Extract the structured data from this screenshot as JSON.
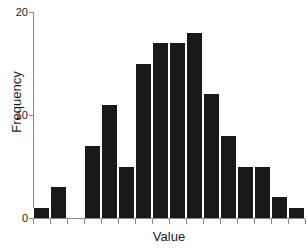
{
  "chart_data": {
    "type": "bar",
    "title": "",
    "subtitle": "",
    "xlabel": "Value",
    "ylabel": "Frequency",
    "grid": false,
    "legend": null,
    "ylim": [
      0,
      20
    ],
    "ytick_labels": [
      "0",
      "10",
      "20"
    ],
    "ytick_values": [
      0,
      10,
      20
    ],
    "xtick_labels": [
      "",
      "",
      "",
      "",
      "",
      "",
      "",
      "",
      "",
      "",
      "",
      "",
      "",
      "",
      "",
      ""
    ],
    "xtick_count": 16,
    "bar_count": 16,
    "categories": [
      "b1",
      "b2",
      "b3",
      "b4",
      "b5",
      "b6",
      "b7",
      "b8",
      "b9",
      "b10",
      "b11",
      "b12",
      "b13",
      "b14",
      "b15",
      "b16"
    ],
    "values": [
      1,
      3,
      0,
      7,
      11,
      5,
      15,
      17,
      17,
      18,
      12,
      8,
      5,
      5,
      2,
      0
    ],
    "outlier_bar": {
      "value": 1,
      "position_index": 15
    },
    "bar_color": "#191919",
    "axis_color": "#8a8a8a",
    "background_color": "#ffffff",
    "text_color": "#1a1a1a",
    "note": "histogram of Value vs Frequency with a single isolated bar of height 1 at the far right of the axis"
  },
  "axes": {
    "y": {
      "label": "Frequency",
      "ticks": [
        {
          "label": "20",
          "value": 20
        },
        {
          "label": "10",
          "value": 10
        },
        {
          "label": "0",
          "value": 0
        }
      ]
    },
    "x": {
      "label": "Value"
    }
  }
}
